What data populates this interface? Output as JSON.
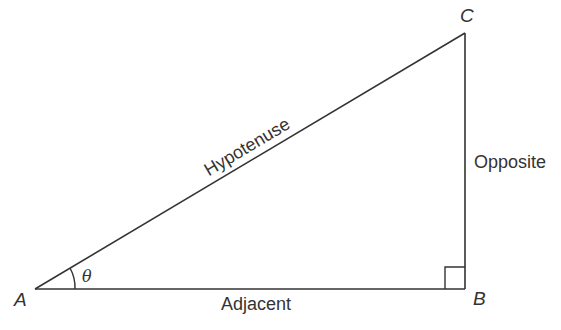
{
  "diagram": {
    "type": "right-triangle",
    "vertices": {
      "A": {
        "label": "A"
      },
      "B": {
        "label": "B"
      },
      "C": {
        "label": "C"
      }
    },
    "sides": {
      "hypotenuse": "Hypotenuse",
      "opposite": "Opposite",
      "adjacent": "Adjacent"
    },
    "angle": {
      "label": "θ"
    },
    "right_angle_at": "B",
    "colors": {
      "stroke": "#333333",
      "background": "#ffffff"
    }
  }
}
